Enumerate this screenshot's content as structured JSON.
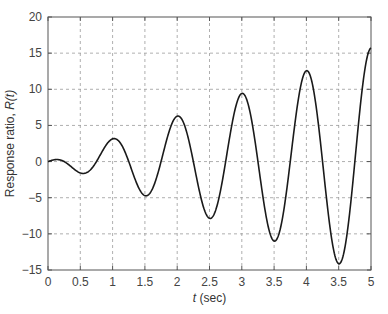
{
  "chart_data": {
    "type": "line",
    "title": "",
    "xlabel_italic": "t",
    "xlabel_rest": " (sec)",
    "ylabel_main": "Response ratio, ",
    "ylabel_italic": "R(t)",
    "xlim": [
      0,
      5
    ],
    "ylim": [
      -15,
      20
    ],
    "grid": true,
    "grid_style": "dashed",
    "legend": null,
    "x_ticks": [
      0,
      0.5,
      1,
      1.5,
      2,
      2.5,
      3,
      3.5,
      4,
      4.5,
      5
    ],
    "x_tick_labels": [
      "0",
      "0.5",
      "1",
      "1.5",
      "2",
      "2.5",
      "3",
      "3.5",
      "4",
      "3.5",
      "5"
    ],
    "y_ticks": [
      -15,
      -10,
      -5,
      0,
      5,
      10,
      15,
      20
    ],
    "y_tick_labels": [
      "−15",
      "−10",
      "−5",
      "0",
      "5",
      "10",
      "15",
      "20"
    ],
    "series": [
      {
        "name": "R(t)",
        "color": "#1a1a1a",
        "x": [
          0,
          0.1,
          0.25,
          0.4,
          0.5,
          0.55,
          0.75,
          1.0,
          1.25,
          1.5,
          1.75,
          2.0,
          2.25,
          2.5,
          2.75,
          3.0,
          3.25,
          3.5,
          3.75,
          4.0,
          4.25,
          4.5,
          4.75,
          5.0
        ],
        "y": [
          0,
          0.25,
          0,
          -1.0,
          -1.57,
          -1.6,
          0,
          3.14,
          0,
          -4.71,
          0,
          6.28,
          0,
          -7.85,
          0,
          9.42,
          0,
          -11.0,
          0,
          12.57,
          0,
          -14.14,
          0,
          15.7
        ],
        "peaks": [
          {
            "t": 0.1,
            "R": 0.3
          },
          {
            "t": 0.55,
            "R": -1.6
          },
          {
            "t": 1.0,
            "R": 3.2
          },
          {
            "t": 1.5,
            "R": -4.7
          },
          {
            "t": 2.0,
            "R": 6.4
          },
          {
            "t": 2.5,
            "R": -7.9
          },
          {
            "t": 3.0,
            "R": 9.5
          },
          {
            "t": 3.5,
            "R": -11.0
          },
          {
            "t": 4.0,
            "R": 12.6
          },
          {
            "t": 4.5,
            "R": -14.2
          },
          {
            "t": 5.0,
            "R": 15.8
          }
        ]
      }
    ],
    "layout": {
      "plot_left": 48,
      "plot_right": 371,
      "plot_top": 17,
      "plot_bottom": 270
    }
  }
}
